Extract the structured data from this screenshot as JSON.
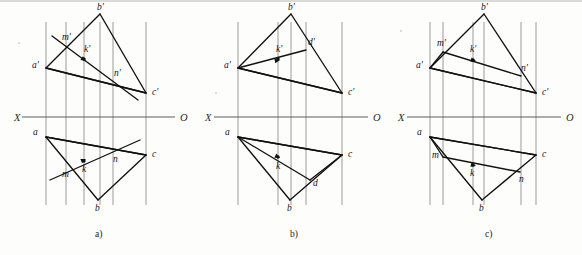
{
  "sheet": {
    "title": "Descriptive geometry: three-view projection exercises",
    "background_color": "#fdfdfc",
    "line_color": "#111111",
    "projection_line_color": "#8e8e8e",
    "axis_color": "#5f5f5f"
  },
  "axis": {
    "left_label": "X",
    "right_label": "O",
    "y": 117
  },
  "figures": [
    {
      "id": "a",
      "caption": "a)",
      "caption_x": 95,
      "caption_y": 237,
      "axis_x_label_pos": [
        14,
        121
      ],
      "axis_o_label_pos": [
        180,
        121
      ],
      "axis_start_x": 22,
      "axis_end_x": 175,
      "points": {
        "b_prime": {
          "label": "b'",
          "x": 100,
          "y": 14,
          "lx": 97,
          "ly": 10
        },
        "a_prime": {
          "label": "a'",
          "x": 46,
          "y": 68,
          "lx": 32,
          "ly": 68
        },
        "c_prime": {
          "label": "c'",
          "x": 146,
          "y": 93,
          "lx": 152,
          "ly": 95
        },
        "m_prime": {
          "label": "m'",
          "x": 66,
          "y": 48,
          "lx": 62,
          "ly": 40
        },
        "k_prime": {
          "label": "k'",
          "x": 84,
          "y": 59,
          "lx": 84,
          "ly": 52
        },
        "n_prime": {
          "label": "n'",
          "x": 113,
          "y": 80,
          "lx": 114,
          "ly": 76
        },
        "b": {
          "label": "b",
          "x": 98,
          "y": 200,
          "lx": 95,
          "ly": 211
        },
        "a": {
          "label": "a",
          "x": 46,
          "y": 137,
          "lx": 33,
          "ly": 135
        },
        "c": {
          "label": "c",
          "x": 146,
          "y": 155,
          "lx": 152,
          "ly": 157
        },
        "m": {
          "label": "m",
          "x": 65,
          "y": 168,
          "lx": 62,
          "ly": 177
        },
        "k": {
          "label": "k",
          "x": 84,
          "y": 161,
          "lx": 82,
          "ly": 172
        },
        "n": {
          "label": "n",
          "x": 113,
          "y": 151,
          "lx": 113,
          "ly": 162
        }
      },
      "triangle_top": [
        "a_prime",
        "b_prime",
        "c_prime"
      ],
      "triangle_bottom": [
        "a",
        "b",
        "c"
      ],
      "cross_lines_top": [
        [
          "a_prime",
          "c_prime"
        ]
      ],
      "cross_lines_bottom": [
        [
          "a",
          "c"
        ]
      ],
      "mn_line_top": {
        "from": [
          52,
          36
        ],
        "to": [
          138,
          100
        ]
      },
      "mn_line_bottom": {
        "from": [
          50,
          180
        ],
        "to": [
          140,
          140
        ]
      },
      "arrow_top": {
        "from": [
          66,
          48
        ],
        "to": [
          86,
          61
        ]
      },
      "arrow_bottom": {
        "from": [
          65,
          168
        ],
        "to": [
          86,
          159
        ]
      },
      "projection_x": [
        66,
        84,
        100,
        113,
        146,
        46
      ],
      "dot_points": [
        "k_prime",
        "k"
      ]
    },
    {
      "id": "b",
      "caption": "b)",
      "caption_x": 290,
      "caption_y": 237,
      "axis_x_label_pos": [
        205,
        121
      ],
      "axis_o_label_pos": [
        373,
        121
      ],
      "axis_start_x": 214,
      "axis_end_x": 368,
      "points": {
        "b_prime": {
          "label": "b'",
          "x": 291,
          "y": 14,
          "lx": 288,
          "ly": 10
        },
        "a_prime": {
          "label": "a'",
          "x": 238,
          "y": 68,
          "lx": 224,
          "ly": 68
        },
        "c_prime": {
          "label": "c'",
          "x": 342,
          "y": 93,
          "lx": 348,
          "ly": 95
        },
        "d_prime": {
          "label": "d'",
          "x": 306,
          "y": 50,
          "lx": 308,
          "ly": 45
        },
        "k_prime": {
          "label": "k'",
          "x": 278,
          "y": 59,
          "lx": 276,
          "ly": 52
        },
        "b": {
          "label": "b",
          "x": 290,
          "y": 200,
          "lx": 287,
          "ly": 211
        },
        "a": {
          "label": "a",
          "x": 238,
          "y": 137,
          "lx": 225,
          "ly": 135
        },
        "c": {
          "label": "c",
          "x": 342,
          "y": 155,
          "lx": 348,
          "ly": 157
        },
        "d": {
          "label": "d",
          "x": 310,
          "y": 180,
          "lx": 313,
          "ly": 186
        },
        "k": {
          "label": "k",
          "x": 278,
          "y": 157,
          "lx": 276,
          "ly": 169
        }
      },
      "triangle_top": [
        "a_prime",
        "b_prime",
        "c_prime"
      ],
      "triangle_bottom": [
        "a",
        "b",
        "c"
      ],
      "cross_lines_top": [
        [
          "a_prime",
          "c_prime"
        ],
        [
          "a_prime",
          "d_prime"
        ]
      ],
      "cross_lines_bottom": [
        [
          "a",
          "c"
        ],
        [
          "a",
          "d"
        ]
      ],
      "extra_lines_bottom": [
        [
          "d",
          "c"
        ]
      ],
      "arrow_top": {
        "from": [
          238,
          68
        ],
        "to": [
          280,
          60
        ]
      },
      "arrow_bottom": {
        "from": [
          238,
          137
        ],
        "to": [
          280,
          158
        ]
      },
      "projection_x": [
        238,
        278,
        291,
        306,
        342
      ],
      "dot_points": [
        "k_prime",
        "k"
      ]
    },
    {
      "id": "c",
      "caption": "c)",
      "caption_x": 485,
      "caption_y": 237,
      "axis_x_label_pos": [
        398,
        121
      ],
      "axis_o_label_pos": [
        566,
        121
      ],
      "axis_start_x": 407,
      "axis_end_x": 561,
      "points": {
        "b_prime": {
          "label": "b'",
          "x": 484,
          "y": 14,
          "lx": 481,
          "ly": 10
        },
        "a_prime": {
          "label": "a'",
          "x": 430,
          "y": 68,
          "lx": 416,
          "ly": 68
        },
        "c_prime": {
          "label": "c'",
          "x": 536,
          "y": 93,
          "lx": 542,
          "ly": 95
        },
        "m_prime": {
          "label": "m'",
          "x": 443,
          "y": 52,
          "lx": 437,
          "ly": 46
        },
        "k_prime": {
          "label": "k'",
          "x": 473,
          "y": 60,
          "lx": 470,
          "ly": 52
        },
        "n_prime": {
          "label": "n'",
          "x": 521,
          "y": 76,
          "lx": 521,
          "ly": 71
        },
        "b": {
          "label": "b",
          "x": 482,
          "y": 200,
          "lx": 479,
          "ly": 211
        },
        "a": {
          "label": "a",
          "x": 430,
          "y": 137,
          "lx": 417,
          "ly": 135
        },
        "c": {
          "label": "c",
          "x": 536,
          "y": 155,
          "lx": 542,
          "ly": 157
        },
        "m": {
          "label": "m",
          "x": 443,
          "y": 157,
          "lx": 432,
          "ly": 158
        },
        "k": {
          "label": "k",
          "x": 473,
          "y": 165,
          "lx": 470,
          "ly": 176
        },
        "n": {
          "label": "n",
          "x": 520,
          "y": 172,
          "lx": 519,
          "ly": 182
        }
      },
      "triangle_top": [
        "a_prime",
        "b_prime",
        "c_prime"
      ],
      "triangle_bottom": [
        "a",
        "b",
        "c"
      ],
      "cross_lines_top": [
        [
          "a_prime",
          "c_prime"
        ],
        [
          "m_prime",
          "n_prime"
        ]
      ],
      "cross_lines_bottom": [
        [
          "a",
          "c"
        ],
        [
          "m",
          "n"
        ]
      ],
      "extra_lines_top": [
        [
          "m_prime",
          "a_prime"
        ]
      ],
      "extra_lines_bottom": [
        [
          "m",
          "a"
        ]
      ],
      "arrow_top": {
        "from": [
          443,
          52
        ],
        "to": [
          476,
          61
        ]
      },
      "arrow_bottom": {
        "from": [
          443,
          157
        ],
        "to": [
          476,
          166
        ]
      },
      "projection_x": [
        430,
        443,
        473,
        484,
        521,
        536
      ],
      "dot_points": [
        "k_prime",
        "k"
      ]
    }
  ]
}
